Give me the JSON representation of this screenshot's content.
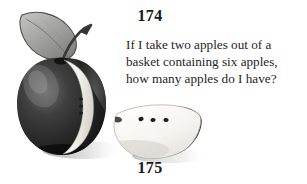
{
  "page": {
    "background_color": "#ffffff",
    "width": 307,
    "height": 184
  },
  "numbers": {
    "top": "174",
    "bottom": "175"
  },
  "riddle": {
    "full_text": "If I take two apples out of a basket containing six apples, how many apples do I have?",
    "lines": [
      "If I take two apples out of a",
      "basket containing six apples,",
      "how many apples do I have?"
    ]
  },
  "illustration": {
    "name": "apple-illustration",
    "description": "A dark apple with a leaf and stem, a white wedge cut from its side, and a separate white apple slice resting beside it",
    "parts": [
      {
        "name": "apple-leaf",
        "color": "#9a9a9a"
      },
      {
        "name": "apple-stem",
        "color": "#3a3a3a"
      },
      {
        "name": "apple-body",
        "color": "#272727"
      },
      {
        "name": "apple-cut-wedge",
        "color": "#f4f2ee"
      },
      {
        "name": "apple-slice",
        "color": "#f6f4f0"
      },
      {
        "name": "apple-seeds",
        "color": "#1c1c1c"
      },
      {
        "name": "apple-shadow",
        "color": "#c9c9c9"
      }
    ]
  }
}
